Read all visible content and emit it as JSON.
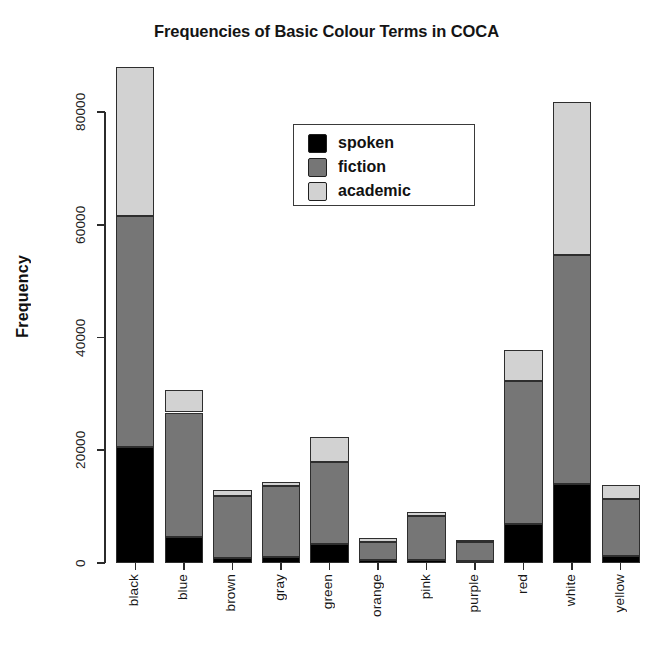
{
  "chart_data": {
    "type": "bar",
    "subtype": "stacked-bar",
    "title": "Frequencies of Basic Colour Terms in COCA",
    "xlabel": "",
    "ylabel": "Frequency",
    "ylim": [
      0,
      88000
    ],
    "yticks": [
      0,
      20000,
      40000,
      60000,
      80000
    ],
    "ytick_labels": [
      "0",
      "20000",
      "40000",
      "60000",
      "80000"
    ],
    "grid": false,
    "legend_position": "upper center",
    "categories": [
      "black",
      "blue",
      "brown",
      "gray",
      "green",
      "orange",
      "pink",
      "purple",
      "red",
      "white",
      "yellow"
    ],
    "series": [
      {
        "name": "spoken",
        "color": "#000000",
        "values": [
          20500,
          4700,
          900,
          1100,
          3400,
          500,
          600,
          400,
          7000,
          14000,
          1200
        ]
      },
      {
        "name": "fiction",
        "color": "#767676",
        "values": [
          41000,
          22000,
          11000,
          12600,
          14500,
          3300,
          7800,
          3300,
          25300,
          40700,
          10100
        ]
      },
      {
        "name": "academic",
        "color": "#d2d2d2",
        "values": [
          26500,
          4000,
          1000,
          700,
          4500,
          700,
          600,
          400,
          5400,
          27000,
          2500
        ]
      }
    ],
    "totals": [
      88000,
      30700,
      12900,
      14400,
      22400,
      4500,
      9000,
      4100,
      37700,
      81700,
      13800
    ]
  },
  "legend": {
    "items": [
      {
        "label": "spoken",
        "color": "#000000"
      },
      {
        "label": "fiction",
        "color": "#767676"
      },
      {
        "label": "academic",
        "color": "#d2d2d2"
      }
    ]
  }
}
